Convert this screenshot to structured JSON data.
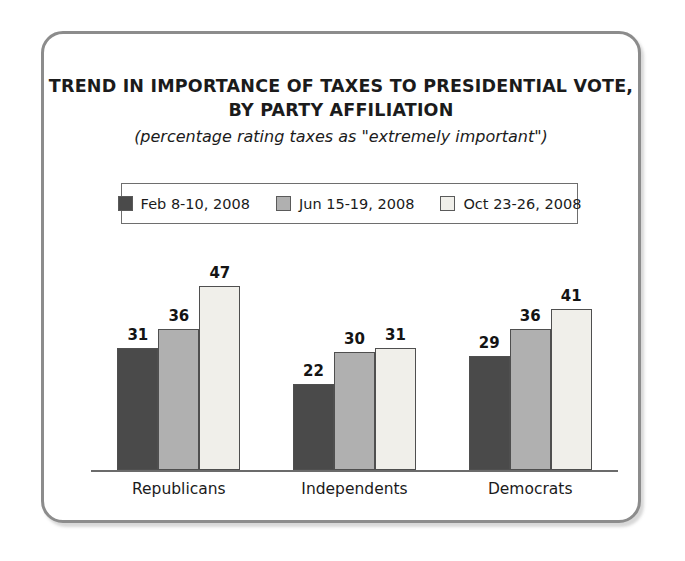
{
  "chart_data": {
    "type": "bar",
    "title": "TREND IN IMPORTANCE OF TAXES TO PRESIDENTIAL VOTE, BY PARTY AFFILIATION",
    "title_lines": [
      "TREND IN IMPORTANCE OF TAXES TO PRESIDENTIAL VOTE,",
      "BY PARTY AFFILIATION"
    ],
    "subtitle": "(percentage rating taxes as \"extremely important\")",
    "xlabel": "",
    "ylabel": "",
    "ylim": [
      0,
      52
    ],
    "grid": false,
    "legend_position": "top-center",
    "categories": [
      "Republicans",
      "Independents",
      "Democrats"
    ],
    "series": [
      {
        "name": "Feb 8-10, 2008",
        "color": "#4a4a4a",
        "values": [
          31,
          22,
          29
        ]
      },
      {
        "name": "Jun 15-19, 2008",
        "color": "#b0b0b0",
        "values": [
          36,
          30,
          36
        ]
      },
      {
        "name": "Oct 23-26, 2008",
        "color": "#f0efea",
        "values": [
          47,
          31,
          41
        ]
      }
    ]
  },
  "style": {
    "frame_border_color": "#8c8c8c",
    "axis_color": "#6b6b6b",
    "text_color": "#1b1b1b",
    "background": "#ffffff"
  }
}
